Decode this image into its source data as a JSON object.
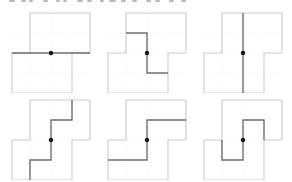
{
  "canvas": {
    "width": 292,
    "height": 182
  },
  "theme": {
    "colors": {
      "canvas": "#ffffff",
      "caption": "#8f8f8f",
      "outline": "#c9cbca",
      "cut": "#6f6f6f",
      "dot": "#161616",
      "grid": "#ededed"
    }
  },
  "caption": {
    "description": "bottom edge of a cropped text line, glyphs cut off and illegible",
    "fragments": [
      {
        "x": 9,
        "w": 6
      },
      {
        "x": 21,
        "w": 5
      },
      {
        "x": 29,
        "w": 4
      },
      {
        "x": 43,
        "w": 5
      },
      {
        "x": 56,
        "w": 4
      },
      {
        "x": 63,
        "w": 4
      },
      {
        "x": 77,
        "w": 6
      },
      {
        "x": 87,
        "w": 5
      },
      {
        "x": 100,
        "w": 4
      },
      {
        "x": 109,
        "w": 7
      },
      {
        "x": 121,
        "w": 5
      },
      {
        "x": 132,
        "w": 5
      },
      {
        "x": 146,
        "w": 5
      },
      {
        "x": 155,
        "w": 5
      },
      {
        "x": 169,
        "w": 5
      },
      {
        "x": 181,
        "w": 5
      }
    ]
  },
  "figure": {
    "shape": {
      "description": "centrally symmetric region made of two equal offset rectangles sharing a horizontal mid-line; dot marks center of symmetry",
      "outline_points": "25,4 85,4 85,44 67,44 67,84 7,84 7,44 25,44 25,4",
      "grid_path": "M25 4V84M46 4V84M67 4V84M7 24H85M7 44H85M7 64H85"
    },
    "panels": [
      {
        "cut_type": "horizontal-line-through-center",
        "cut_points": "7,44 85,44",
        "dot_x": 46,
        "dot_y": 44
      },
      {
        "cut_type": "z-step-left-edge-to-right-edge",
        "cut_points": "25,24 46,24 46,64 67,64",
        "dot_x": 46,
        "dot_y": 44
      },
      {
        "cut_type": "vertical-line-through-center",
        "cut_points": "46,4 46,84",
        "dot_x": 46,
        "dot_y": 44
      },
      {
        "cut_type": "staircase-top-edge-to-bottom-edge",
        "cut_points": "67,4 67,24 46,24 46,64 25,64 25,84",
        "dot_x": 46,
        "dot_y": 44
      },
      {
        "cut_type": "z-step-right-edge-to-left-edge",
        "cut_points": "85,24 46,24 46,64 7,64",
        "dot_x": 46,
        "dot_y": 44
      },
      {
        "cut_type": "hooked-s-between-reflex-corners",
        "cut_points": "67,44 67,24 46,24 46,64 25,64 25,44",
        "dot_x": 46,
        "dot_y": 44
      }
    ],
    "layout": {
      "panel_width": 90,
      "panel_height": 84,
      "lefts": [
        5,
        101,
        197
      ],
      "tops": [
        9,
        96
      ]
    }
  }
}
